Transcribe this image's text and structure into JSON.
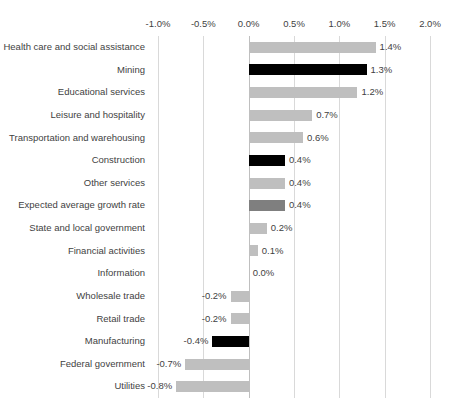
{
  "chart_data": {
    "type": "bar",
    "orientation": "horizontal",
    "title": "",
    "subtitle": "",
    "xlabel": "",
    "ylabel": "",
    "xlim": [
      -1.0,
      2.0
    ],
    "xticks": [
      -1.0,
      -0.5,
      0.0,
      0.5,
      1.0,
      1.5,
      2.0
    ],
    "xtick_labels": [
      "-1.0%",
      "-0.5%",
      "0.0%",
      "0.5%",
      "1.0%",
      "1.5%",
      "2.0%"
    ],
    "grid": true,
    "grid_axis": "x",
    "legend": false,
    "legend_position": "none",
    "categories": [
      "Health care and social assistance",
      "Mining",
      "Educational services",
      "Leisure and hospitality",
      "Transportation and warehousing",
      "Construction",
      "Other services",
      "Expected average growth rate",
      "State and local government",
      "Financial activities",
      "Information",
      "Wholesale trade",
      "Retail trade",
      "Manufacturing",
      "Federal government",
      "Utilities"
    ],
    "values": [
      1.4,
      1.3,
      1.2,
      0.7,
      0.6,
      0.4,
      0.4,
      0.4,
      0.2,
      0.1,
      0.0,
      -0.2,
      -0.2,
      -0.4,
      -0.7,
      -0.8
    ],
    "data_labels": [
      "1.4%",
      "1.3%",
      "1.2%",
      "0.7%",
      "0.6%",
      "0.4%",
      "0.4%",
      "0.4%",
      "0.2%",
      "0.1%",
      "0.0%",
      "-0.2%",
      "-0.2%",
      "-0.4%",
      "-0.7%",
      "-0.8%"
    ],
    "bar_colors": [
      "#bfbfbf",
      "#000000",
      "#bfbfbf",
      "#bfbfbf",
      "#bfbfbf",
      "#000000",
      "#bfbfbf",
      "#7f7f7f",
      "#bfbfbf",
      "#bfbfbf",
      "#bfbfbf",
      "#bfbfbf",
      "#bfbfbf",
      "#000000",
      "#bfbfbf",
      "#bfbfbf"
    ],
    "colors": {
      "default_bar": "#bfbfbf",
      "highlight_bar": "#000000",
      "average_bar": "#7f7f7f",
      "gridline": "#d9d9d9",
      "zero_line": "#bfbfbf",
      "text": "#3f3f3f",
      "background": "#ffffff"
    }
  }
}
